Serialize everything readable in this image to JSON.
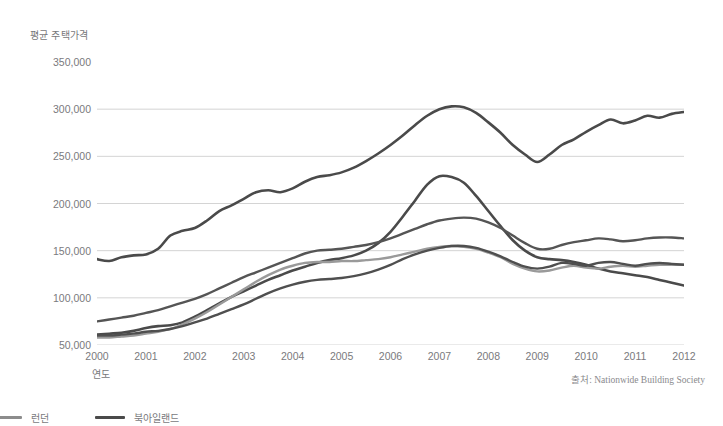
{
  "chart_data": {
    "type": "line",
    "title": "",
    "ylabel": "평균 주택가격",
    "xlabel": "연도",
    "source": "출처: Nationwide Building Society",
    "grid": true,
    "legend_position": "bottom-left",
    "xlim": [
      2000,
      2012
    ],
    "ylim": [
      50000,
      350000
    ],
    "ytick_values": [
      350000,
      300000,
      250000,
      200000,
      150000,
      100000,
      50000
    ],
    "ytick_labels": [
      "350,000",
      "300,000",
      "250,000",
      "200,000",
      "150,000",
      "100,000",
      "50,000"
    ],
    "xtick_labels": [
      "2000",
      "2001",
      "2002",
      "2003",
      "2004",
      "2005",
      "2006",
      "2007",
      "2008",
      "2009",
      "2010",
      "2011",
      "2012"
    ],
    "x": [
      2000,
      2000.25,
      2000.5,
      2000.75,
      2001,
      2001.25,
      2001.5,
      2001.75,
      2002,
      2002.25,
      2002.5,
      2002.75,
      2003,
      2003.25,
      2003.5,
      2003.75,
      2004,
      2004.25,
      2004.5,
      2004.75,
      2005,
      2005.25,
      2005.5,
      2005.75,
      2006,
      2006.25,
      2006.5,
      2006.75,
      2007,
      2007.25,
      2007.5,
      2007.75,
      2008,
      2008.25,
      2008.5,
      2008.75,
      2009,
      2009.25,
      2009.5,
      2009.75,
      2010,
      2010.25,
      2010.5,
      2010.75,
      2011,
      2011.25,
      2011.5,
      2011.75,
      2012
    ],
    "series": [
      {
        "name": "런던",
        "color": "#4a4a4a",
        "width": 2.6,
        "values": [
          141000,
          139000,
          143000,
          145000,
          146000,
          152000,
          166000,
          171000,
          174000,
          182000,
          192000,
          198000,
          205000,
          212000,
          214000,
          212000,
          216000,
          223000,
          228000,
          230000,
          233000,
          238000,
          245000,
          253000,
          262000,
          272000,
          283000,
          293000,
          300000,
          303000,
          302000,
          296000,
          286000,
          275000,
          262000,
          252000,
          244000,
          252000,
          262000,
          268000,
          276000,
          283000,
          289000,
          285000,
          288000,
          293000,
          291000,
          295000,
          297000
        ]
      },
      {
        "name": "북아일랜드",
        "color": "#4a4a4a",
        "width": 2.6,
        "values": [
          61000,
          62000,
          63000,
          65000,
          68000,
          70000,
          71000,
          74000,
          80000,
          87000,
          94000,
          101000,
          107000,
          113000,
          119000,
          124000,
          129000,
          133000,
          137000,
          140000,
          142000,
          145000,
          150000,
          158000,
          170000,
          186000,
          203000,
          220000,
          229000,
          228000,
          222000,
          208000,
          192000,
          176000,
          161000,
          150000,
          143000,
          141000,
          140000,
          138000,
          135000,
          131000,
          128000,
          126000,
          124000,
          122000,
          119000,
          116000,
          113000
        ]
      },
      {
        "name": "잉글랜드 북서부",
        "color": "#555555",
        "width": 2.4,
        "values": [
          75000,
          77000,
          79000,
          81000,
          84000,
          87000,
          91000,
          95000,
          99000,
          104000,
          110000,
          116000,
          122000,
          127000,
          132000,
          137000,
          142000,
          147000,
          150000,
          151000,
          152000,
          154000,
          156000,
          159000,
          163000,
          168000,
          173000,
          178000,
          182000,
          184000,
          185000,
          184000,
          180000,
          174000,
          166000,
          158000,
          152000,
          152000,
          156000,
          159000,
          161000,
          163000,
          162000,
          160000,
          161000,
          163000,
          164000,
          164000,
          163000
        ]
      },
      {
        "name": "웨일스",
        "color": "#9a9a9a",
        "width": 2.4,
        "values": [
          58000,
          58000,
          59000,
          60000,
          62000,
          64000,
          67000,
          72000,
          78000,
          85000,
          93000,
          101000,
          109000,
          117000,
          124000,
          130000,
          134000,
          137000,
          138000,
          138000,
          139000,
          139000,
          140000,
          141000,
          143000,
          146000,
          149000,
          152000,
          154000,
          155000,
          154000,
          152000,
          148000,
          143000,
          136000,
          131000,
          128000,
          129000,
          132000,
          134000,
          132000,
          131000,
          133000,
          134000,
          133000,
          134000,
          135000,
          135000,
          135000
        ]
      },
      {
        "name": "스코틀랜드",
        "color": "#4f4f4f",
        "width": 2.4,
        "values": [
          60000,
          60000,
          61000,
          62000,
          64000,
          65000,
          67000,
          70000,
          74000,
          78000,
          83000,
          88000,
          93000,
          99000,
          105000,
          110000,
          114000,
          117000,
          119000,
          120000,
          121000,
          123000,
          126000,
          130000,
          135000,
          141000,
          146000,
          150000,
          153000,
          155000,
          155000,
          153000,
          149000,
          144000,
          138000,
          133000,
          131000,
          133000,
          137000,
          136000,
          134000,
          137000,
          138000,
          136000,
          134000,
          136000,
          137000,
          136000,
          135000
        ]
      }
    ],
    "legend_visible": [
      {
        "name": "런던",
        "color": "#8c8c8c"
      },
      {
        "name": "북아일랜드",
        "color": "#4a4a4a"
      }
    ]
  }
}
